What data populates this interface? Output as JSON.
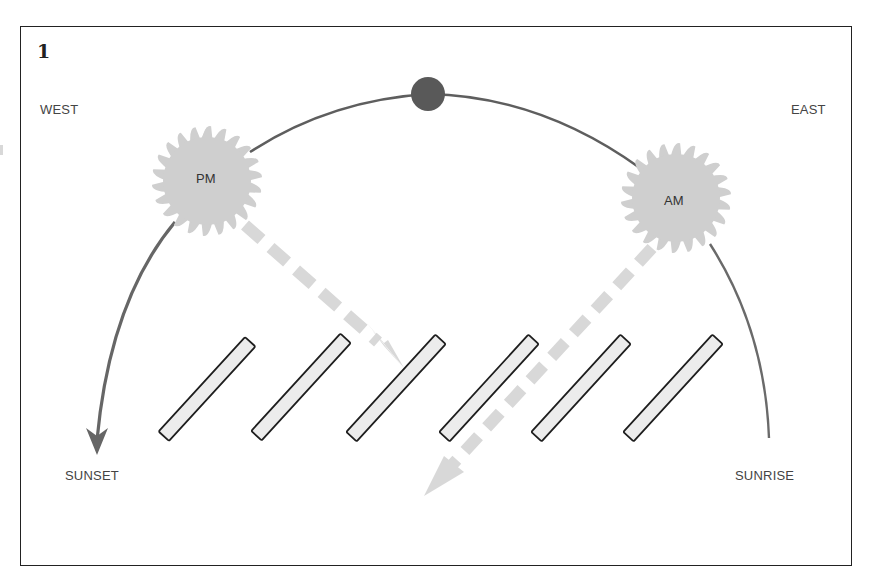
{
  "figure": {
    "number": "1"
  },
  "labels": {
    "west": "WEST",
    "east": "EAST",
    "sunset": "SUNSET",
    "sunrise": "SUNRISE"
  },
  "suns": [
    {
      "id": "pm",
      "label": "PM",
      "side": "west"
    },
    {
      "id": "am",
      "label": "AM",
      "side": "east"
    }
  ],
  "zenith": {
    "label": ""
  },
  "panels": {
    "count": 6
  },
  "colors": {
    "frame": "#222222",
    "arc": "#666666",
    "sun": "#cfcfcf",
    "zenith_dot": "#5a5a5a",
    "light_path": "#d6d6d6",
    "panel_fill": "#ececec",
    "panel_stroke": "#1e1e1e",
    "text": "#444444"
  }
}
